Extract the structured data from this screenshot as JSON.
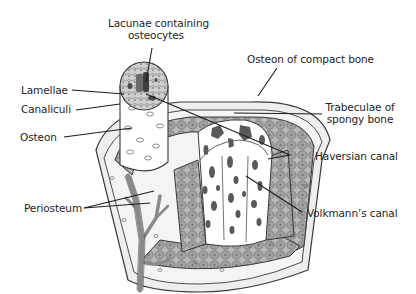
{
  "labels": {
    "lacunae_line1": "Lacunae containing",
    "lacunae_line2": "osteocytes",
    "lamellae": "Lamellae",
    "canaliculi": "Canaliculi",
    "osteon": "Osteon",
    "periosteum": "Periosteum",
    "osteon_compact": "Osteon of compact bone",
    "trabeculae_line1": "Trabeculae of",
    "trabeculae_line2": "spongy bone",
    "haversian": "Haversian canal",
    "volkmann": "Volkmann’s canal"
  },
  "colors": {
    "outline": "#3a3a3a",
    "periosteum_fill": "#eeeeee",
    "compact_fill": "#b5b5b5",
    "osteon_cell_fill": "#9a9a9a",
    "spongy_fill": "#ffffff",
    "trabeculae_spot": "#5a5a5a",
    "vessel": "#8a8a8a",
    "leader_line": "#1e1e1e"
  }
}
